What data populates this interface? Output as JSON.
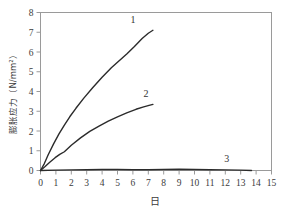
{
  "chart_data": {
    "type": "line",
    "title": "",
    "xlabel": "日",
    "ylabel": "膨胀应力（N/mm²）",
    "ylabel_name": "膨胀应力",
    "ylabel_unit": "（N/mm²）",
    "xlim": [
      0,
      15
    ],
    "ylim": [
      0,
      8
    ],
    "grid": false,
    "legend": "inline-end-labels",
    "xticks": [
      "0",
      "1",
      "2",
      "3",
      "4",
      "5",
      "6",
      "7",
      "8",
      "9",
      "10",
      "11",
      "12",
      "13",
      "14",
      "15"
    ],
    "yticks": [
      "0",
      "1",
      "2",
      "3",
      "4",
      "5",
      "6",
      "7",
      "8"
    ],
    "series": [
      {
        "name": "1",
        "label": "1",
        "color": "#2b2b2b",
        "x": [
          0,
          0.25,
          0.5,
          0.85,
          1.2,
          1.55,
          1.9,
          2.3,
          2.8,
          3.4,
          4.0,
          4.6,
          5.2,
          5.6,
          6.1,
          6.6,
          7.0,
          7.3
        ],
        "y": [
          0,
          0.35,
          0.8,
          1.35,
          1.85,
          2.3,
          2.72,
          3.15,
          3.65,
          4.2,
          4.72,
          5.2,
          5.62,
          5.9,
          6.28,
          6.68,
          6.95,
          7.1
        ]
      },
      {
        "name": "2",
        "label": "2",
        "color": "#2b2b2b",
        "x": [
          0,
          0.3,
          0.6,
          0.95,
          1.25,
          1.55,
          2.0,
          2.6,
          3.2,
          3.8,
          4.4,
          5.0,
          5.6,
          6.2,
          6.7,
          7.05,
          7.3
        ],
        "y": [
          0,
          0.2,
          0.42,
          0.65,
          0.82,
          0.95,
          1.28,
          1.65,
          1.98,
          2.25,
          2.5,
          2.72,
          2.92,
          3.1,
          3.22,
          3.3,
          3.35
        ]
      },
      {
        "name": "3",
        "label": "3",
        "color": "#2b2b2b",
        "x": [
          0,
          1.0,
          2.0,
          3.0,
          4.0,
          5.0,
          6.0,
          7.0,
          8.0,
          9.0,
          10.0,
          11.0,
          12.0,
          13.0,
          13.7
        ],
        "y": [
          0,
          0.02,
          0.03,
          0.04,
          0.05,
          0.05,
          0.04,
          0.04,
          0.05,
          0.06,
          0.05,
          0.04,
          0.03,
          0.02,
          0.0
        ]
      }
    ],
    "series_labels": [
      {
        "text": "1",
        "x": 6.0,
        "y": 7.45
      },
      {
        "text": "2",
        "x": 6.85,
        "y": 3.72
      },
      {
        "text": "3",
        "x": 12.1,
        "y": 0.42
      }
    ]
  }
}
